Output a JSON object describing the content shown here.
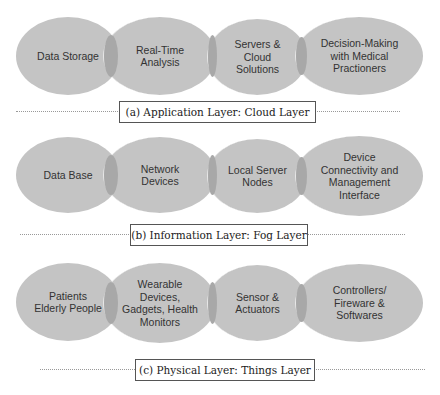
{
  "layers": [
    {
      "label": "(a)  Application Layer: Cloud Layer",
      "items": [
        "Data Storage",
        "Real-Time\nAnalysis",
        "Servers &\nCloud\nSolutions",
        "Decision-Making\nwith Medical\nPractioners"
      ]
    },
    {
      "label": "(b) Information Layer: Fog Layer",
      "items": [
        "Data Base",
        "Network\nDevices",
        "Local Server\nNodes",
        "Device\nConnectivity and\nManagement\nInterface"
      ]
    },
    {
      "label": "(c) Physical Layer: Things Layer",
      "items": [
        "Patients\nElderly People",
        "Wearable\nDevices,\nGadgets, Health\nMonitors",
        "Sensor &\nActuators",
        "Controllers/\nFireware &\nSoftwares"
      ]
    }
  ],
  "colors": {
    "ellipse": "#c4c4c4",
    "overlap": "#a8a8a8",
    "border": "#555555"
  }
}
